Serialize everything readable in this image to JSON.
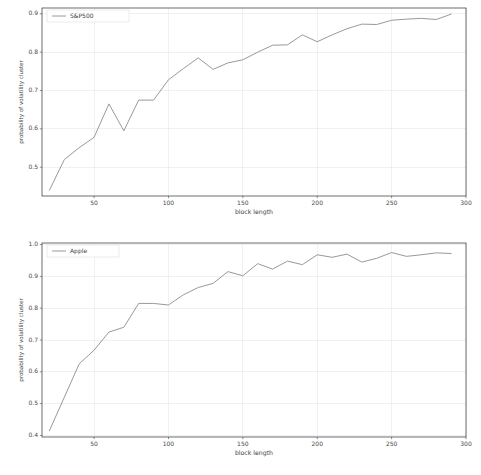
{
  "chart_data": [
    {
      "type": "line",
      "id": "sp500",
      "title": "",
      "xlabel": "block length",
      "ylabel": "probability of volatility cluster",
      "xlim": [
        15,
        300
      ],
      "ylim": [
        0.425,
        0.915
      ],
      "xticks": [
        50,
        100,
        150,
        200,
        250,
        300
      ],
      "yticks": [
        0.5,
        0.6,
        0.7,
        0.8,
        0.9
      ],
      "xticklabels": [
        "50",
        "100",
        "150",
        "200",
        "250",
        "300"
      ],
      "yticklabels": [
        "0.5",
        "0.6",
        "0.7",
        "0.8",
        "0.9"
      ],
      "grid": true,
      "legend_position": "upper left",
      "series": [
        {
          "name": "S&P500",
          "color": "#8d8d8d",
          "x": [
            20,
            30,
            40,
            50,
            60,
            70,
            80,
            90,
            100,
            110,
            120,
            130,
            140,
            150,
            160,
            170,
            180,
            190,
            200,
            210,
            220,
            230,
            240,
            250,
            260,
            270,
            280,
            290
          ],
          "y": [
            0.44,
            0.52,
            0.551,
            0.578,
            0.665,
            0.595,
            0.675,
            0.675,
            0.728,
            0.757,
            0.785,
            0.755,
            0.772,
            0.78,
            0.8,
            0.818,
            0.819,
            0.845,
            0.827,
            0.845,
            0.861,
            0.873,
            0.872,
            0.883,
            0.886,
            0.888,
            0.885,
            0.899
          ]
        }
      ]
    },
    {
      "type": "line",
      "id": "apple",
      "title": "",
      "xlabel": "block length",
      "ylabel": "probability of volatility cluster",
      "xlim": [
        15,
        300
      ],
      "ylim": [
        0.395,
        1.005
      ],
      "xticks": [
        50,
        100,
        150,
        200,
        250,
        300
      ],
      "yticks": [
        0.4,
        0.5,
        0.6,
        0.7,
        0.8,
        0.9,
        1.0
      ],
      "xticklabels": [
        "50",
        "100",
        "150",
        "200",
        "250",
        "300"
      ],
      "yticklabels": [
        "0.4",
        "0.5",
        "0.6",
        "0.7",
        "0.8",
        "0.9",
        "1.0"
      ],
      "grid": true,
      "legend_position": "upper left",
      "series": [
        {
          "name": "Apple",
          "color": "#8d8d8d",
          "x": [
            20,
            30,
            40,
            50,
            60,
            70,
            80,
            90,
            100,
            110,
            120,
            130,
            140,
            150,
            160,
            170,
            180,
            190,
            200,
            210,
            220,
            230,
            240,
            250,
            260,
            270,
            280,
            290
          ],
          "y": [
            0.415,
            0.52,
            0.625,
            0.668,
            0.725,
            0.74,
            0.815,
            0.815,
            0.81,
            0.842,
            0.865,
            0.878,
            0.915,
            0.902,
            0.94,
            0.923,
            0.948,
            0.937,
            0.968,
            0.96,
            0.97,
            0.945,
            0.957,
            0.975,
            0.963,
            0.968,
            0.974,
            0.972
          ]
        }
      ]
    }
  ]
}
